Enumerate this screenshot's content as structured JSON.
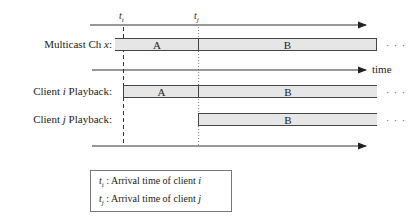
{
  "markers": {
    "ti": "t",
    "ti_sub": "i",
    "tj": "t",
    "tj_sub": "j"
  },
  "rows": [
    {
      "label_pre": "Multicast Ch ",
      "label_var": "x",
      "label_post": ":",
      "segments": [
        "A",
        "B"
      ]
    },
    {
      "label_pre": "Client ",
      "label_var": "i",
      "label_post": " Playback:",
      "segments": [
        "A",
        "B"
      ]
    },
    {
      "label_pre": "Client ",
      "label_var": "j",
      "label_post": " Playback:",
      "segments": [
        "B"
      ]
    }
  ],
  "axis_label": "time",
  "ellipsis": "· · ·",
  "legend": [
    {
      "sym": "t",
      "sub": "i",
      "text": " : Arrival time of client ",
      "var": "i"
    },
    {
      "sym": "t",
      "sub": "j",
      "text": " : Arrival time of client ",
      "var": "j"
    }
  ]
}
